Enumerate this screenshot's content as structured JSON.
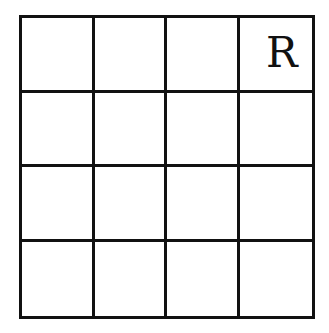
{
  "grid": {
    "rows": 4,
    "cols": 4,
    "line_color": "#111111",
    "background": "#ffffff",
    "cells": [
      [
        "",
        "",
        "",
        "R"
      ],
      [
        "",
        "",
        "",
        ""
      ],
      [
        "",
        "",
        "",
        ""
      ],
      [
        "",
        "",
        "",
        ""
      ]
    ]
  }
}
